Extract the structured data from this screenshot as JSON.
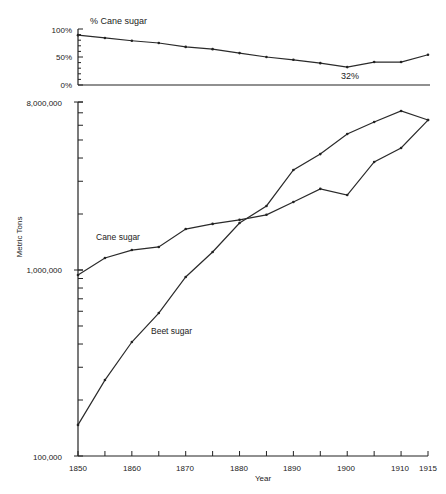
{
  "figure": {
    "top_title": "% Cane sugar",
    "top_annotation": "32%",
    "top_y_ticks": [
      "100%",
      "50%",
      "0%"
    ],
    "bottom_y_label": "Metric Tons",
    "bottom_x_label": "Year",
    "bottom_y_tick_labels": [
      "8,000,000",
      "1,000,000",
      "100,000"
    ],
    "x_tick_labels": [
      "1850",
      "1860",
      "1870",
      "1880",
      "1890",
      "1900",
      "1910",
      "1915"
    ],
    "series_labels": {
      "cane": "Cane sugar",
      "beet": "Beet sugar"
    },
    "colors": {
      "line": "#2a2a2a",
      "axis": "#222222",
      "background": "#ffffff"
    }
  },
  "chart_data": [
    {
      "type": "line",
      "title": "% Cane sugar",
      "xlabel": "",
      "ylabel": "",
      "x": [
        1850,
        1855,
        1860,
        1865,
        1870,
        1875,
        1880,
        1885,
        1890,
        1895,
        1900,
        1905,
        1910,
        1915
      ],
      "series": [
        {
          "name": "% Cane sugar",
          "values": [
            89,
            84,
            79,
            75,
            68,
            64,
            57,
            50,
            45,
            39,
            32,
            41,
            41,
            54
          ]
        }
      ],
      "ylim": [
        0,
        100
      ],
      "yticks": [
        "0%",
        "50%",
        "100%"
      ],
      "annotations": [
        {
          "x": 1900,
          "text": "32%"
        }
      ],
      "grid": false
    },
    {
      "type": "line",
      "title": "",
      "xlabel": "Year",
      "ylabel": "Metric Tons",
      "yscale": "log",
      "x": [
        1850,
        1855,
        1860,
        1865,
        1870,
        1875,
        1880,
        1885,
        1890,
        1895,
        1900,
        1905,
        1910,
        1915
      ],
      "series": [
        {
          "name": "Cane sugar",
          "values": [
            940000,
            1160000,
            1280000,
            1330000,
            1660000,
            1770000,
            1860000,
            1980000,
            2320000,
            2730000,
            2530000,
            3810000,
            4530000,
            6400000
          ]
        },
        {
          "name": "Beet sugar",
          "values": [
            147000,
            256000,
            410000,
            587000,
            917000,
            1250000,
            1790000,
            2210000,
            3450000,
            4200000,
            5380000,
            6250000,
            7160000,
            6400000
          ]
        }
      ],
      "ylim": [
        100000,
        8000000
      ],
      "yticks": [
        "100,000",
        "1,000,000",
        "8,000,000"
      ],
      "xticks": [
        "1850",
        "1860",
        "1870",
        "1880",
        "1890",
        "1900",
        "1910",
        "1915"
      ],
      "legend": "inline labels",
      "grid": false
    }
  ]
}
